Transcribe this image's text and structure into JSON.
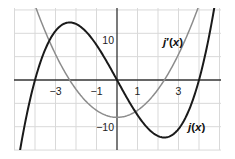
{
  "chart_data": {
    "type": "line",
    "title": "",
    "xlabel": "",
    "ylabel": "",
    "xlim": [
      -5.0,
      5.1
    ],
    "ylim": [
      -15.0,
      15.4
    ],
    "grid": true,
    "x_grid_step": 1,
    "y_grid_step": 5,
    "x_tick_labels": [
      {
        "value": -3,
        "label": "−3"
      },
      {
        "value": -1,
        "label": "−1"
      },
      {
        "value": 1,
        "label": "1"
      },
      {
        "value": 3,
        "label": "3"
      }
    ],
    "y_tick_labels": [
      {
        "value": 10,
        "label": "10"
      },
      {
        "value": -10,
        "label": "−10"
      }
    ],
    "series": [
      {
        "name": "j(x)",
        "label_parts": [
          "j",
          "(",
          "x",
          ")"
        ],
        "color": "#1a1a1a",
        "width": 2.0,
        "formula": "0.5x^3 - 8x",
        "coeffs": [
          0,
          -8,
          0,
          0.5
        ],
        "x": [
          -4.5,
          -4,
          -3,
          -2.31,
          -1,
          0,
          1,
          2.31,
          3,
          4,
          4.5
        ],
        "values": [
          -9.56,
          0,
          10.5,
          12.32,
          7.5,
          0,
          -7.5,
          -12.32,
          -10.5,
          0,
          9.56
        ]
      },
      {
        "name": "j′(x)",
        "label_parts": [
          "j",
          "′(",
          "x",
          ")"
        ],
        "color": "#8c8c8c",
        "width": 1.5,
        "formula": "1.5x^2 - 8",
        "coeffs": [
          -8,
          0,
          1.5,
          0
        ],
        "x": [
          -3.5,
          -3,
          -2.31,
          -1,
          0,
          1,
          2.31,
          3,
          3.5
        ],
        "values": [
          10.38,
          5.5,
          0,
          -6.5,
          -8,
          -6.5,
          0,
          5.5,
          10.38
        ]
      }
    ],
    "annotations": [
      {
        "text": "j′(x)",
        "x": 2.2,
        "y": 9
      },
      {
        "text": "j(x)",
        "x": 3.3,
        "y": -10.5
      }
    ]
  }
}
